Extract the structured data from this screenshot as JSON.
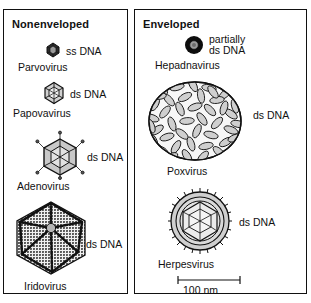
{
  "figure": {
    "background": "#ffffff",
    "line_color": "#111111",
    "fill_gray": "#c9c9c9"
  },
  "panels": [
    {
      "id": "nonenveloped",
      "title": "Nonenveloped",
      "viruses": [
        {
          "name": "Parvovirus",
          "genome": "ss DNA",
          "icon": "small-icosahedron-dark-icon"
        },
        {
          "name": "Papovavirus",
          "genome": "ds DNA",
          "icon": "icosahedron-icon"
        },
        {
          "name": "Adenovirus",
          "genome": "ds DNA",
          "icon": "icosahedron-with-fibers-icon"
        },
        {
          "name": "Iridovirus",
          "genome": "ds DNA",
          "icon": "stippled-hexagon-capsid-icon"
        }
      ]
    },
    {
      "id": "enveloped",
      "title": "Enveloped",
      "viruses": [
        {
          "name": "Hepadnavirus",
          "genome": "partially ds DNA",
          "genome_line1": "partially",
          "genome_line2": "ds DNA",
          "icon": "dark-sphere-core-icon"
        },
        {
          "name": "Poxvirus",
          "genome": "ds DNA",
          "icon": "brick-shaped-oval-icon"
        },
        {
          "name": "Herpesvirus",
          "genome": "ds DNA",
          "icon": "enveloped-icosahedron-spiked-icon"
        }
      ]
    }
  ],
  "scale": {
    "label": "100 nm",
    "bar_length_px": 62
  }
}
